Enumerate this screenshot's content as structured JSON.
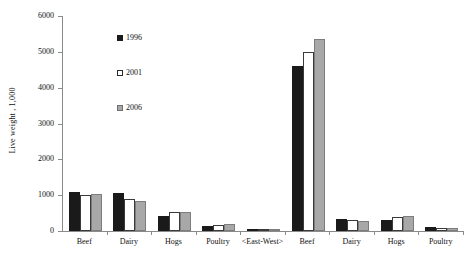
{
  "chart_data": {
    "type": "bar",
    "title": "",
    "subtitle": "",
    "xlabel": "",
    "ylabel": "Live weight , 1,000",
    "ylim": [
      0,
      6000
    ],
    "ytick_labels": [
      "6000",
      "5000",
      "4000",
      "3000",
      "2000",
      "1000",
      "0"
    ],
    "ytick_values": [
      6000,
      5000,
      4000,
      3000,
      2000,
      1000,
      0
    ],
    "grid": false,
    "legend_position": "upper-left-inside",
    "categories": [
      "Beef",
      "Dairy",
      "Hogs",
      "Poultry",
      "<East-West>",
      "Beef",
      "Dairy",
      "Hogs",
      "Poultry"
    ],
    "series": [
      {
        "name": "1996",
        "color": "#1a1a1a",
        "values": [
          1100,
          1050,
          420,
          150,
          0,
          4600,
          330,
          320,
          100
        ]
      },
      {
        "name": "2001",
        "color": "#ffffff",
        "values": [
          1000,
          900,
          530,
          180,
          0,
          5000,
          300,
          400,
          90
        ]
      },
      {
        "name": "2006",
        "color": "#a8a8a8",
        "values": [
          1030,
          850,
          530,
          190,
          0,
          5350,
          270,
          430,
          80
        ]
      }
    ],
    "legend": [
      {
        "label": "1996",
        "swatch": "black-square"
      },
      {
        "label": "2001",
        "swatch": "white-square"
      },
      {
        "label": "2006",
        "swatch": "gray-square"
      }
    ]
  }
}
